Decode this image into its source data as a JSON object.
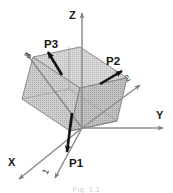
{
  "figure": {
    "type": "3d-diagram",
    "title": "",
    "background_color": "#ffffff",
    "global_axes": [
      {
        "id": "x",
        "label": "X",
        "description": "global X axis pointing down-left toward viewer"
      },
      {
        "id": "y",
        "label": "Y",
        "description": "global Y axis pointing right"
      },
      {
        "id": "z",
        "label": "Z",
        "description": "global Z axis pointing up"
      }
    ],
    "local_axes": [
      {
        "id": "axis1",
        "label": "1",
        "description": "principal axis 1 pointing down-left"
      },
      {
        "id": "axis2",
        "label": "2",
        "description": "principal axis 2 pointing up-right"
      },
      {
        "id": "axis3",
        "label": "3",
        "description": "principal axis 3 pointing up-left"
      }
    ],
    "vectors": [
      {
        "id": "p1",
        "label": "P1",
        "description": "principal force vector P1 pointing down"
      },
      {
        "id": "p2",
        "label": "P2",
        "description": "principal force vector P2 pointing up-right"
      },
      {
        "id": "p3",
        "label": "P3",
        "description": "principal force vector P3 pointing up-left"
      }
    ],
    "body": {
      "name": "cube",
      "description": "tilted semi-transparent gray cube centered at origin",
      "face_color": "#c9c9c9",
      "edge_color": "#8a8a8a"
    },
    "colors": {
      "axis_line": "#8c8c8c",
      "vector_arrow": "#1a1a1a",
      "label_text": "#141414",
      "cube_face_light": "#d2d2d2",
      "cube_face_mid": "#c4c4c4",
      "cube_face_dark": "#b6b6b6",
      "cube_edge": "#7f7f7f"
    },
    "caption": "Fig. 1.1"
  }
}
